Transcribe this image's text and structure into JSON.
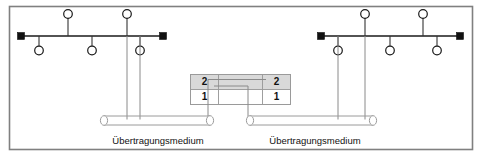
{
  "figure": {
    "frame": {
      "color": "#808080"
    }
  },
  "buses": [
    {
      "id": "left-bus",
      "terminator_left": "terminator",
      "terminator_right": "terminator",
      "nodes_above": 2,
      "nodes_below": 3
    },
    {
      "id": "right-bus",
      "terminator_left": "terminator",
      "terminator_right": "terminator",
      "nodes_above": 2,
      "nodes_below": 3
    }
  ],
  "coupler": {
    "left_port": {
      "upper_label": "2",
      "lower_label": "1"
    },
    "right_port": {
      "upper_label": "2",
      "lower_label": "1"
    }
  },
  "media": [
    {
      "id": "left-medium",
      "label": "Übertragungsmedium"
    },
    {
      "id": "right-medium",
      "label": "Übertragungsmedium"
    }
  ],
  "colors": {
    "line": "#1a1a1a",
    "frame": "#808080",
    "cell_fill": "#d9d9d9",
    "cell_border": "#9a9a9a",
    "background": "#ffffff"
  }
}
